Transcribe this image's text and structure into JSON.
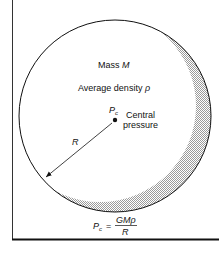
{
  "diagram": {
    "mass_label": "Mass ",
    "mass_symbol": "M",
    "density_label": "Average density ",
    "density_symbol": "ρ",
    "pc_symbol": "P",
    "pc_subscript": "c",
    "central_label_1": "Central",
    "central_label_2": "pressure",
    "radius_label": "R",
    "formula": {
      "lhs": "P",
      "lhs_sub": "c",
      "equals": "=",
      "numerator": "GMρ",
      "denominator": "R"
    }
  },
  "colors": {
    "ink": "#111111",
    "shade": "#bdbdbd"
  }
}
